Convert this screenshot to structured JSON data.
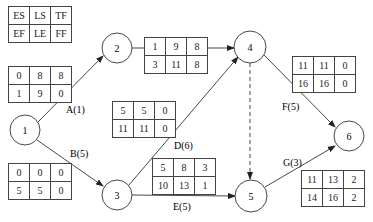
{
  "legend": {
    "row1": [
      "ES",
      "LS",
      "TF"
    ],
    "row2": [
      "EF",
      "LE",
      "FF"
    ]
  },
  "nodes": [
    {
      "id": "1",
      "cx": 25,
      "cy": 130
    },
    {
      "id": "2",
      "cx": 117,
      "cy": 48
    },
    {
      "id": "3",
      "cx": 117,
      "cy": 195
    },
    {
      "id": "4",
      "cx": 250,
      "cy": 47
    },
    {
      "id": "5",
      "cx": 251,
      "cy": 196
    },
    {
      "id": "6",
      "cx": 349,
      "cy": 136
    }
  ],
  "activities": [
    {
      "label": "A(1)",
      "from": "1",
      "to": "2",
      "table": {
        "row1": [
          "0",
          "8",
          "8"
        ],
        "row2": [
          "1",
          "9",
          "0"
        ]
      }
    },
    {
      "label": "B(5)",
      "from": "1",
      "to": "3",
      "table": {
        "row1": [
          "0",
          "0",
          "0"
        ],
        "row2": [
          "5",
          "5",
          "0"
        ]
      }
    },
    {
      "label": "C(2)",
      "from": "2",
      "to": "4",
      "table": {
        "row1": [
          "1",
          "9",
          "8"
        ],
        "row2": [
          "3",
          "11",
          "8"
        ]
      }
    },
    {
      "label": "D(6)",
      "from": "3",
      "to": "4",
      "table": {
        "row1": [
          "5",
          "5",
          "0"
        ],
        "row2": [
          "11",
          "11",
          "0"
        ]
      }
    },
    {
      "label": "E(5)",
      "from": "3",
      "to": "5",
      "table": {
        "row1": [
          "5",
          "8",
          "3"
        ],
        "row2": [
          "10",
          "13",
          "1"
        ]
      }
    },
    {
      "label": "F(5)",
      "from": "4",
      "to": "6",
      "table": {
        "row1": [
          "11",
          "11",
          "0"
        ],
        "row2": [
          "16",
          "16",
          "0"
        ]
      }
    },
    {
      "label": "G(3)",
      "from": "5",
      "to": "6",
      "table": {
        "row1": [
          "11",
          "13",
          "2"
        ],
        "row2": [
          "14",
          "16",
          "2"
        ]
      }
    },
    {
      "label": "",
      "from": "4",
      "to": "5",
      "dummy": true
    }
  ]
}
